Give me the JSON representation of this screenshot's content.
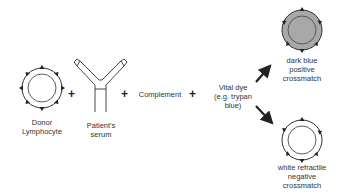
{
  "diagram": {
    "donor": {
      "label_line1": "Donor",
      "label_line2": "Lymphocyte"
    },
    "serum": {
      "label_line1": "Patient's",
      "label_line2": "serum"
    },
    "plus": "+",
    "complement": "Complement",
    "dye": {
      "line1": "Vital dye",
      "line2": "(e.g. trypan",
      "line3": "blue)"
    },
    "positive": {
      "line1": "dark blue",
      "line2": "positive",
      "line3": "crossmatch"
    },
    "negative": {
      "line1": "white refractile",
      "line2": "negative",
      "line3": "crossmatch"
    },
    "colors": {
      "stroke": "#222222",
      "positive_fill": "#a8a8a8"
    }
  }
}
